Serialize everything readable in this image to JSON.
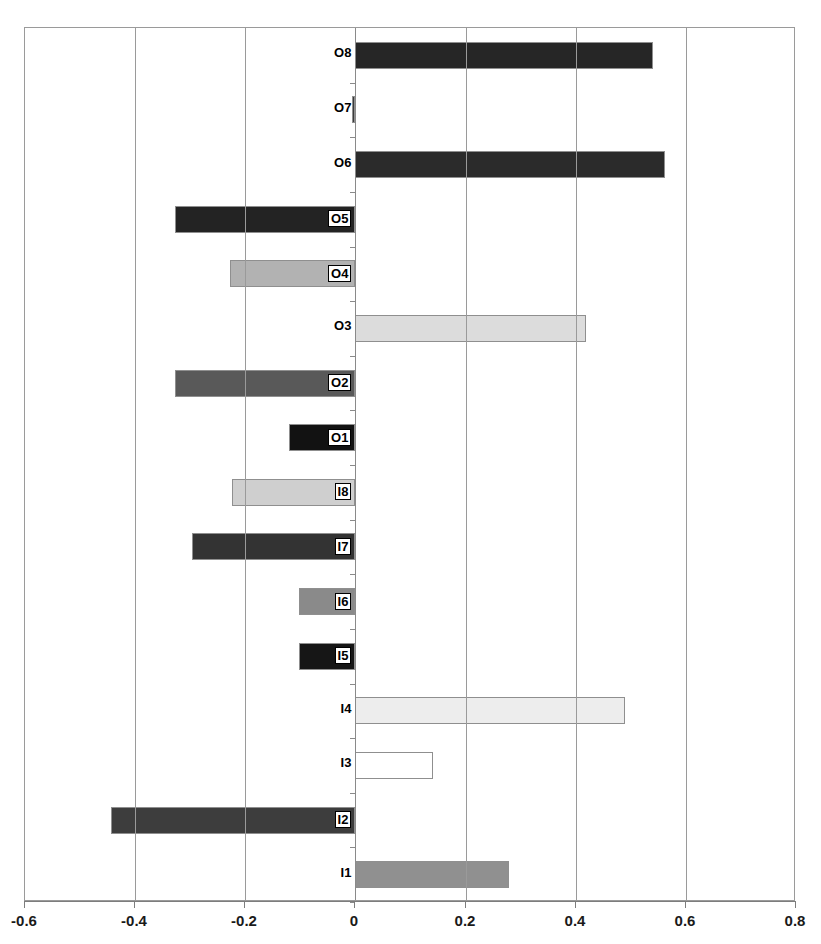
{
  "chart_data": {
    "type": "bar",
    "orientation": "horizontal",
    "title": "",
    "xlabel": "",
    "ylabel": "",
    "xlim": [
      -0.6,
      0.8
    ],
    "xticks": [
      -0.6,
      -0.4,
      -0.2,
      0,
      0.2,
      0.4,
      0.6,
      0.8
    ],
    "xticklabels": [
      "-0.6",
      "-0.4",
      "-0.2",
      "0",
      "0.2",
      "0.4",
      "0.6",
      "0.8"
    ],
    "grid": "vertical",
    "legend": "none",
    "categories": [
      "I1",
      "I2",
      "I3",
      "I4",
      "I5",
      "I6",
      "I7",
      "I8",
      "O1",
      "O2",
      "O3",
      "O4",
      "O5",
      "O6",
      "O7",
      "O8"
    ],
    "values": [
      0.278,
      -0.443,
      0.14,
      0.489,
      -0.102,
      -0.102,
      -0.296,
      -0.225,
      -0.12,
      -0.327,
      0.418,
      -0.227,
      -0.327,
      0.563,
      -0.006,
      0.54
    ],
    "bars": [
      {
        "label": "O8",
        "value": 0.54,
        "fill": "#262626",
        "label_style": "plain"
      },
      {
        "label": "O7",
        "value": -0.006,
        "fill": "#3a3a3a",
        "label_style": "plain"
      },
      {
        "label": "O6",
        "value": 0.563,
        "fill": "#2b2b2b",
        "label_style": "plain"
      },
      {
        "label": "O5",
        "value": -0.327,
        "fill": "#232323",
        "label_style": "boxed"
      },
      {
        "label": "O4",
        "value": -0.227,
        "fill": "#b2b2b2",
        "label_style": "boxed"
      },
      {
        "label": "O3",
        "value": 0.418,
        "fill": "#dcdcdc",
        "label_style": "plain"
      },
      {
        "label": "O2",
        "value": -0.327,
        "fill": "#595959",
        "label_style": "boxed"
      },
      {
        "label": "O1",
        "value": -0.12,
        "fill": "#121212",
        "label_style": "boxed"
      },
      {
        "label": "I8",
        "value": -0.225,
        "fill": "#cfcfcf",
        "label_style": "boxed"
      },
      {
        "label": "I7",
        "value": -0.296,
        "fill": "#333333",
        "label_style": "boxed"
      },
      {
        "label": "I6",
        "value": -0.102,
        "fill": "#8a8a8a",
        "label_style": "boxed"
      },
      {
        "label": "I5",
        "value": -0.102,
        "fill": "#161616",
        "label_style": "boxed"
      },
      {
        "label": "I4",
        "value": 0.489,
        "fill": "#ededed",
        "label_style": "plain"
      },
      {
        "label": "I3",
        "value": 0.14,
        "fill": "#ffffff",
        "label_style": "plain"
      },
      {
        "label": "I2",
        "value": -0.443,
        "fill": "#3d3d3d",
        "label_style": "boxed"
      },
      {
        "label": "I1",
        "value": 0.278,
        "fill": "#909090",
        "label_style": "plain"
      }
    ]
  },
  "axis": {
    "zero_value": 0,
    "tick_color": "#7d7d7d",
    "grid_color": "#9a9a9a",
    "frame_color": "#9a9a9a"
  }
}
